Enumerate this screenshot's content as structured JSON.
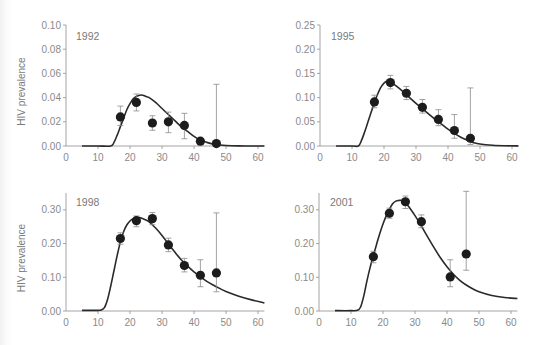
{
  "chart_data": [
    {
      "type": "scatter",
      "title": "1992",
      "xlabel": "",
      "ylabel": "HIV prevalence",
      "xlim": [
        0,
        62
      ],
      "ylim": [
        0,
        0.1
      ],
      "xticks": [
        0,
        10,
        20,
        30,
        40,
        50,
        60
      ],
      "yticks": [
        "0.00",
        "0.02",
        "0.04",
        "0.06",
        "0.08",
        "0.10"
      ],
      "yticks_values": [
        0,
        0.02,
        0.04,
        0.06,
        0.08,
        0.1
      ],
      "grid": false,
      "points": {
        "x": [
          17,
          22,
          27,
          32,
          37,
          42,
          47
        ],
        "y": [
          0.024,
          0.036,
          0.019,
          0.02,
          0.017,
          0.004,
          0.002
        ],
        "err_low": [
          0.017,
          0.029,
          0.013,
          0.011,
          0.006,
          0.001,
          0.0
        ],
        "err_high": [
          0.033,
          0.043,
          0.025,
          0.028,
          0.027,
          0.006,
          0.051
        ]
      },
      "curve": {
        "x": [
          5,
          10,
          14,
          15,
          16,
          17,
          18,
          19,
          20,
          21,
          22,
          23,
          24,
          25,
          26,
          28,
          30,
          32,
          34,
          36,
          38,
          40,
          42,
          44,
          46,
          48,
          50,
          54,
          58,
          62
        ],
        "y": [
          0,
          0,
          0,
          0.003,
          0.009,
          0.016,
          0.023,
          0.03,
          0.035,
          0.039,
          0.041,
          0.042,
          0.042,
          0.041,
          0.04,
          0.036,
          0.031,
          0.026,
          0.021,
          0.016,
          0.012,
          0.008,
          0.005,
          0.003,
          0.0015,
          0.0008,
          0.0004,
          0.0001,
          0,
          0
        ]
      }
    },
    {
      "type": "scatter",
      "title": "1995",
      "xlabel": "",
      "ylabel": "",
      "xlim": [
        0,
        62
      ],
      "ylim": [
        0,
        0.25
      ],
      "xticks": [
        0,
        10,
        20,
        30,
        40,
        50,
        60
      ],
      "yticks": [
        "0.00",
        "0.05",
        "0.10",
        "0.15",
        "0.20",
        "0.25"
      ],
      "yticks_values": [
        0,
        0.05,
        0.1,
        0.15,
        0.2,
        0.25
      ],
      "grid": false,
      "points": {
        "x": [
          17,
          22,
          27,
          32,
          37,
          42,
          47
        ],
        "y": [
          0.091,
          0.131,
          0.109,
          0.08,
          0.055,
          0.032,
          0.016
        ],
        "err_low": [
          0.079,
          0.118,
          0.096,
          0.068,
          0.042,
          0.016,
          0.003
        ],
        "err_high": [
          0.105,
          0.146,
          0.123,
          0.096,
          0.075,
          0.065,
          0.12
        ]
      },
      "curve": {
        "x": [
          5,
          10,
          12,
          13,
          14,
          15,
          16,
          17,
          18,
          19,
          20,
          21,
          22,
          23,
          24,
          26,
          28,
          30,
          32,
          34,
          36,
          38,
          40,
          42,
          44,
          46,
          48,
          50,
          54,
          58,
          62
        ],
        "y": [
          0,
          0,
          0,
          0.012,
          0.03,
          0.05,
          0.07,
          0.09,
          0.107,
          0.121,
          0.13,
          0.134,
          0.133,
          0.128,
          0.123,
          0.112,
          0.1,
          0.088,
          0.077,
          0.066,
          0.055,
          0.045,
          0.035,
          0.026,
          0.018,
          0.012,
          0.007,
          0.004,
          0.0015,
          0.0005,
          0.0002
        ]
      }
    },
    {
      "type": "scatter",
      "title": "1998",
      "xlabel": "",
      "ylabel": "HIV prevalence",
      "xlim": [
        0,
        62
      ],
      "ylim": [
        0,
        0.35
      ],
      "xticks": [
        0,
        10,
        20,
        30,
        40,
        50,
        60
      ],
      "yticks": [
        "0.00",
        "0.10",
        "0.20",
        "0.30"
      ],
      "yticks_values": [
        0,
        0.1,
        0.2,
        0.3
      ],
      "grid": false,
      "points": {
        "x": [
          17,
          22,
          27,
          32,
          37,
          42,
          47
        ],
        "y": [
          0.215,
          0.268,
          0.274,
          0.196,
          0.135,
          0.106,
          0.113
        ],
        "err_low": [
          0.198,
          0.25,
          0.256,
          0.176,
          0.116,
          0.072,
          0.057
        ],
        "err_high": [
          0.232,
          0.282,
          0.292,
          0.216,
          0.156,
          0.152,
          0.291
        ]
      },
      "curve": {
        "x": [
          5,
          10,
          11,
          12,
          13,
          14,
          15,
          16,
          17,
          18,
          19,
          20,
          21,
          22,
          23,
          24,
          25,
          26,
          28,
          30,
          32,
          34,
          36,
          38,
          40,
          42,
          44,
          46,
          48,
          50,
          54,
          58,
          62
        ],
        "y": [
          0.002,
          0.002,
          0.003,
          0.01,
          0.035,
          0.075,
          0.12,
          0.165,
          0.205,
          0.235,
          0.255,
          0.267,
          0.274,
          0.277,
          0.277,
          0.274,
          0.27,
          0.264,
          0.246,
          0.224,
          0.199,
          0.175,
          0.152,
          0.133,
          0.116,
          0.101,
          0.088,
          0.077,
          0.067,
          0.058,
          0.044,
          0.033,
          0.024
        ]
      }
    },
    {
      "type": "scatter",
      "title": "2001",
      "xlabel": "",
      "ylabel": "",
      "xlim": [
        0,
        62
      ],
      "ylim": [
        0,
        0.35
      ],
      "xticks": [
        0,
        10,
        20,
        30,
        40,
        50,
        60
      ],
      "yticks": [
        "0.00",
        "0.10",
        "0.20",
        "0.30"
      ],
      "yticks_values": [
        0,
        0.1,
        0.2,
        0.3
      ],
      "grid": false,
      "points": {
        "x": [
          17,
          22,
          27,
          32,
          41,
          46
        ],
        "y": [
          0.161,
          0.29,
          0.324,
          0.265,
          0.101,
          0.169
        ],
        "err_low": [
          0.143,
          0.275,
          0.304,
          0.247,
          0.072,
          0.121
        ],
        "err_high": [
          0.177,
          0.305,
          0.341,
          0.285,
          0.152,
          0.355
        ]
      },
      "curve": {
        "x": [
          5,
          10,
          12,
          13,
          14,
          15,
          16,
          17,
          18,
          19,
          20,
          21,
          22,
          23,
          24,
          25,
          26,
          27,
          28,
          30,
          32,
          34,
          36,
          38,
          40,
          42,
          44,
          46,
          48,
          50,
          54,
          58,
          62
        ],
        "y": [
          0.001,
          0.001,
          0.002,
          0.012,
          0.045,
          0.09,
          0.13,
          0.165,
          0.198,
          0.23,
          0.258,
          0.282,
          0.302,
          0.318,
          0.326,
          0.328,
          0.328,
          0.322,
          0.31,
          0.283,
          0.252,
          0.219,
          0.187,
          0.157,
          0.131,
          0.109,
          0.091,
          0.077,
          0.066,
          0.057,
          0.046,
          0.04,
          0.037
        ]
      }
    }
  ],
  "layout": {
    "panels": [
      {
        "left": 66,
        "right": 258,
        "top": 25,
        "bottom": 146,
        "title_x": 76,
        "title_y": 36
      },
      {
        "left": 320,
        "right": 512,
        "top": 25,
        "bottom": 146,
        "title_x": 331,
        "title_y": 36
      },
      {
        "left": 66,
        "right": 258,
        "top": 193,
        "bottom": 311,
        "title_x": 76,
        "title_y": 202
      },
      {
        "left": 319,
        "right": 511,
        "top": 193,
        "bottom": 311,
        "title_x": 330,
        "title_y": 202
      }
    ],
    "colors": {
      "axis": "#9a9a9a",
      "curve": "#2a2a2a",
      "point": "#1c1c1c",
      "errorbar": "#8a8a8a",
      "text": "#8a8a8a"
    }
  }
}
